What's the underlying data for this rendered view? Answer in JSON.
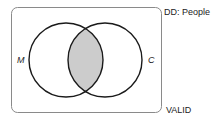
{
  "diagram": {
    "type": "venn",
    "universe_label": "DD: People",
    "verdict_label": "VALID",
    "sets": [
      {
        "name": "M",
        "cx": 66,
        "cy": 60,
        "r": 37
      },
      {
        "name": "C",
        "cx": 105,
        "cy": 60,
        "r": 37
      }
    ],
    "shaded_region": "M ∩ C",
    "colors": {
      "stroke": "#1a1a1a",
      "shade": "#cccccc",
      "border": "#888888"
    }
  }
}
